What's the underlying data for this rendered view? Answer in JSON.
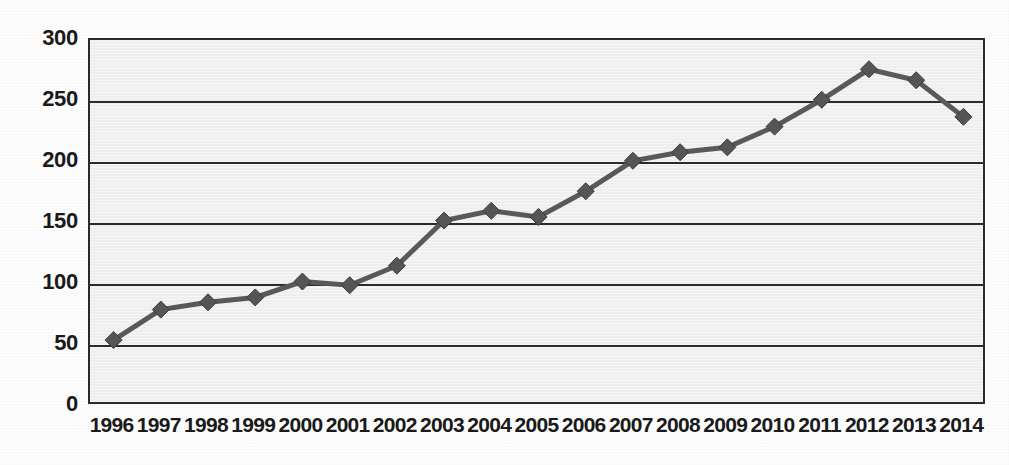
{
  "chart_data": {
    "type": "line",
    "title": "",
    "subtitle": "",
    "xlabel": "",
    "ylabel": "",
    "categories": [
      "1996",
      "1997",
      "1998",
      "1999",
      "2000",
      "2001",
      "2002",
      "2003",
      "2004",
      "2005",
      "2006",
      "2007",
      "2008",
      "2009",
      "2010",
      "2011",
      "2012",
      "2013",
      "2014"
    ],
    "values": [
      54,
      79,
      85,
      89,
      102,
      99,
      115,
      152,
      160,
      155,
      176,
      201,
      208,
      212,
      229,
      251,
      276,
      267,
      237
    ],
    "series": [
      {
        "name": "Series 1",
        "values": [
          54,
          79,
          85,
          89,
          102,
          99,
          115,
          152,
          160,
          155,
          176,
          201,
          208,
          212,
          229,
          251,
          276,
          267,
          237
        ]
      }
    ],
    "ylim": [
      0,
      300
    ],
    "yticks": [
      0,
      50,
      100,
      150,
      200,
      250,
      300
    ],
    "ytick_labels": [
      "0",
      "50",
      "100",
      "150",
      "200",
      "250",
      "300"
    ],
    "grid": "horizontal",
    "legend": "none",
    "marker": "diamond",
    "colors": {
      "line": "#595959",
      "marker": "#555555",
      "plot_background": "#eeeeee",
      "gridline": "#2b2b2b",
      "axis_text": "#1a1a1a",
      "page_background": "#fdfdfd"
    }
  }
}
